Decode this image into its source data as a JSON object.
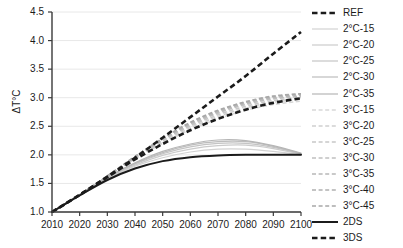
{
  "chart_data": {
    "type": "line",
    "title": "",
    "xlabel": "",
    "ylabel": "ΔT°C",
    "xlim": [
      2010,
      2100
    ],
    "ylim": [
      1.0,
      4.5
    ],
    "grid": true,
    "legend_position": "right",
    "x": [
      2010,
      2020,
      2030,
      2040,
      2050,
      2060,
      2070,
      2080,
      2090,
      2100
    ],
    "xticklabels": [
      "2010",
      "2020",
      "2030",
      "2040",
      "2050",
      "2060",
      "2070",
      "2080",
      "2090",
      "2100"
    ],
    "yticklabels": [
      "1.0",
      "1.5",
      "2.0",
      "2.5",
      "3.0",
      "3.5",
      "4.0",
      "4.5"
    ],
    "yticks": [
      1.0,
      1.5,
      2.0,
      2.5,
      3.0,
      3.5,
      4.0,
      4.5
    ],
    "series": [
      {
        "name": "REF",
        "style": "dashed",
        "color": "#1b1b1b",
        "width": 2.6,
        "values": [
          1.0,
          1.3,
          1.62,
          1.95,
          2.3,
          2.66,
          3.02,
          3.38,
          3.77,
          4.15
        ]
      },
      {
        "name": "2°C-15",
        "style": "solid",
        "color": "#d2d2d2",
        "width": 1.2,
        "values": [
          1.0,
          1.3,
          1.58,
          1.8,
          1.95,
          2.05,
          2.1,
          2.1,
          2.06,
          2.0
        ]
      },
      {
        "name": "2°C-20",
        "style": "solid",
        "color": "#cbcbcb",
        "width": 1.2,
        "values": [
          1.0,
          1.3,
          1.59,
          1.82,
          1.99,
          2.1,
          2.16,
          2.17,
          2.11,
          2.01
        ]
      },
      {
        "name": "2°C-25",
        "style": "solid",
        "color": "#c4c4c4",
        "width": 1.2,
        "values": [
          1.0,
          1.3,
          1.6,
          1.84,
          2.02,
          2.14,
          2.2,
          2.2,
          2.13,
          2.02
        ]
      },
      {
        "name": "2°C-30",
        "style": "solid",
        "color": "#bdbdbd",
        "width": 1.2,
        "values": [
          1.0,
          1.3,
          1.6,
          1.85,
          2.04,
          2.17,
          2.23,
          2.23,
          2.15,
          2.02
        ]
      },
      {
        "name": "2°C-35",
        "style": "solid",
        "color": "#b6b6b6",
        "width": 1.2,
        "values": [
          1.0,
          1.3,
          1.61,
          1.86,
          2.06,
          2.19,
          2.26,
          2.25,
          2.16,
          2.03
        ]
      },
      {
        "name": "3°C-15",
        "style": "dashed",
        "color": "#d8d8d8",
        "width": 1.6,
        "values": [
          1.0,
          1.3,
          1.62,
          1.93,
          2.2,
          2.44,
          2.63,
          2.78,
          2.88,
          2.94
        ]
      },
      {
        "name": "3°C-20",
        "style": "dashed",
        "color": "#d0d0d0",
        "width": 1.6,
        "values": [
          1.0,
          1.3,
          1.62,
          1.94,
          2.22,
          2.47,
          2.67,
          2.82,
          2.92,
          2.97
        ]
      },
      {
        "name": "3°C-25",
        "style": "dashed",
        "color": "#c8c8c8",
        "width": 1.6,
        "values": [
          1.0,
          1.3,
          1.62,
          1.95,
          2.24,
          2.5,
          2.7,
          2.85,
          2.95,
          3.0
        ]
      },
      {
        "name": "3°C-30",
        "style": "dashed",
        "color": "#c0c0c0",
        "width": 1.6,
        "values": [
          1.0,
          1.3,
          1.62,
          1.96,
          2.26,
          2.52,
          2.73,
          2.88,
          2.98,
          3.02
        ]
      },
      {
        "name": "3°C-35",
        "style": "dashed",
        "color": "#b8b8b8",
        "width": 1.6,
        "values": [
          1.0,
          1.3,
          1.62,
          1.96,
          2.27,
          2.54,
          2.75,
          2.9,
          3.0,
          3.04
        ]
      },
      {
        "name": "3°C-40",
        "style": "dashed",
        "color": "#b0b0b0",
        "width": 1.6,
        "values": [
          1.0,
          1.3,
          1.63,
          1.97,
          2.28,
          2.56,
          2.77,
          2.92,
          3.02,
          3.06
        ]
      },
      {
        "name": "3°C-45",
        "style": "dashed",
        "color": "#a8a8a8",
        "width": 1.6,
        "values": [
          1.0,
          1.3,
          1.63,
          1.97,
          2.29,
          2.57,
          2.78,
          2.93,
          3.03,
          3.07
        ]
      },
      {
        "name": "2DS",
        "style": "solid",
        "color": "#1b1b1b",
        "width": 2.0,
        "values": [
          1.0,
          1.29,
          1.56,
          1.76,
          1.89,
          1.96,
          1.99,
          2.0,
          2.0,
          2.0
        ]
      },
      {
        "name": "3DS",
        "style": "dashed",
        "color": "#1b1b1b",
        "width": 2.6,
        "values": [
          1.0,
          1.3,
          1.61,
          1.92,
          2.19,
          2.43,
          2.63,
          2.79,
          2.91,
          2.99
        ]
      }
    ]
  },
  "legend": {
    "items": [
      {
        "label": "REF",
        "series": "REF"
      },
      {
        "label": "2°C-15",
        "series": "2°C-15"
      },
      {
        "label": "2°C-20",
        "series": "2°C-20"
      },
      {
        "label": "2°C-25",
        "series": "2°C-25"
      },
      {
        "label": "2°C-30",
        "series": "2°C-30"
      },
      {
        "label": "2°C-35",
        "series": "2°C-35"
      },
      {
        "label": "3°C-15",
        "series": "3°C-15"
      },
      {
        "label": "3°C-20",
        "series": "3°C-20"
      },
      {
        "label": "3°C-25",
        "series": "3°C-25"
      },
      {
        "label": "3°C-30",
        "series": "3°C-30"
      },
      {
        "label": "3°C-35",
        "series": "3°C-35"
      },
      {
        "label": "3°C-40",
        "series": "3°C-40"
      },
      {
        "label": "3°C-45",
        "series": "3°C-45"
      },
      {
        "label": "2DS",
        "series": "2DS"
      },
      {
        "label": "3DS",
        "series": "3DS"
      }
    ]
  },
  "colors": {
    "axis": "#3a3a3a",
    "grid": "#e8e8e8",
    "text": "#1b1b1b",
    "emphasis": "#1b1b1b"
  }
}
